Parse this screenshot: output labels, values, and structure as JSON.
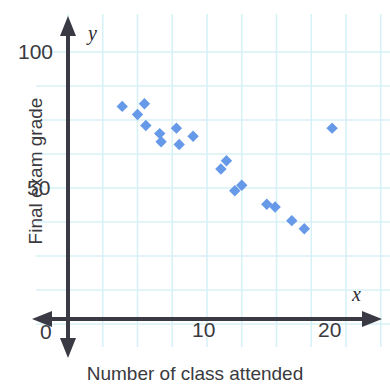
{
  "chart_data": {
    "type": "scatter",
    "title": "",
    "xlabel": "Number of class attended",
    "ylabel": "Final exam grade",
    "xlim": [
      0,
      22.5
    ],
    "ylim": [
      0,
      107
    ],
    "grid": true,
    "grid_step_x": 2.5,
    "grid_step_y": 12.5,
    "legend": "none",
    "x_ticks": [
      {
        "value": 10,
        "label": "10"
      },
      {
        "value": 20,
        "label": "20"
      }
    ],
    "y_ticks": [
      {
        "value": 50,
        "label": "50"
      },
      {
        "value": 100,
        "label": "100"
      }
    ],
    "origin_label": "0",
    "axis_symbol_x": "x",
    "axis_symbol_y": "y",
    "marker": {
      "shape": "diamond",
      "color": "#6699e8",
      "size": 9
    },
    "points": [
      {
        "x": 3.9,
        "y": 80
      },
      {
        "x": 5.0,
        "y": 77
      },
      {
        "x": 5.5,
        "y": 81
      },
      {
        "x": 5.6,
        "y": 73
      },
      {
        "x": 6.6,
        "y": 70
      },
      {
        "x": 6.7,
        "y": 67
      },
      {
        "x": 7.8,
        "y": 72
      },
      {
        "x": 8.0,
        "y": 66
      },
      {
        "x": 9.0,
        "y": 69
      },
      {
        "x": 11.0,
        "y": 57
      },
      {
        "x": 11.4,
        "y": 60
      },
      {
        "x": 12.0,
        "y": 49
      },
      {
        "x": 12.5,
        "y": 51
      },
      {
        "x": 14.3,
        "y": 44
      },
      {
        "x": 14.9,
        "y": 43
      },
      {
        "x": 16.1,
        "y": 38
      },
      {
        "x": 17.0,
        "y": 35
      },
      {
        "x": 19.0,
        "y": 72
      }
    ]
  },
  "axes": {
    "y_axis_title": "Final exam grade",
    "x_axis_title": "Number of class attended",
    "x_symbol": "x",
    "y_symbol": "y",
    "origin": "0",
    "tick_y_100": "100",
    "tick_y_50": "50",
    "tick_x_10": "10",
    "tick_x_20": "20"
  },
  "colors": {
    "marker": "#6699e8",
    "grid": "#d7f2f7",
    "axis": "#3a3a44",
    "text": "#3a3a40"
  }
}
